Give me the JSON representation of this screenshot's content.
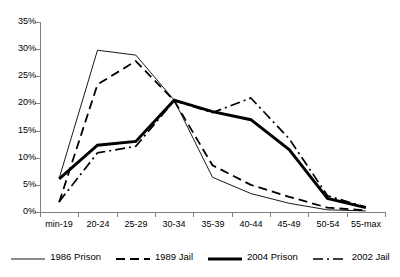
{
  "chart_data": {
    "type": "line",
    "title": "",
    "subtitle": "",
    "xlabel": "",
    "ylabel": "",
    "categories": [
      "min-19",
      "20-24",
      "25-29",
      "30-34",
      "35-39",
      "40-44",
      "45-49",
      "50-54",
      "55-max"
    ],
    "ytick_labels": [
      "0%",
      "5%",
      "10%",
      "15%",
      "20%",
      "25%",
      "30%",
      "35%"
    ],
    "ytick_values": [
      0,
      5,
      10,
      15,
      20,
      25,
      30,
      35
    ],
    "ylim": [
      0,
      35
    ],
    "yunit": "%",
    "grid": false,
    "legend_position": "bottom",
    "series": [
      {
        "name": "1986 Prison",
        "style": "thin-solid",
        "color": "#000000",
        "width": 0.9,
        "dash": "none",
        "values": [
          6.2,
          29.8,
          28.9,
          20.6,
          6.4,
          3.4,
          1.6,
          0.4,
          0.2
        ]
      },
      {
        "name": "1989 Jail",
        "style": "dashed",
        "color": "#000000",
        "width": 1.8,
        "dash": "9,5",
        "values": [
          1.8,
          23.5,
          27.8,
          20.5,
          8.6,
          5.0,
          2.8,
          0.8,
          0.3
        ]
      },
      {
        "name": "2004 Prison",
        "style": "thick-solid",
        "color": "#000000",
        "width": 2.9,
        "dash": "none",
        "values": [
          6.1,
          12.3,
          13.0,
          20.6,
          18.5,
          17.0,
          11.5,
          2.5,
          0.8
        ]
      },
      {
        "name": "2002 Jail",
        "style": "dash-dot",
        "color": "#000000",
        "width": 1.7,
        "dash": "10,4,2,4",
        "values": [
          1.9,
          10.9,
          12.1,
          20.5,
          18.3,
          21.0,
          13.5,
          3.0,
          0.9
        ]
      }
    ]
  },
  "legend": {
    "items": [
      {
        "label": "1986 Prison",
        "swatch": "thin-solid"
      },
      {
        "label": "1989 Jail",
        "swatch": "dashed"
      },
      {
        "label": "2004 Prison",
        "swatch": "thick-solid"
      },
      {
        "label": "2002 Jail",
        "swatch": "dash-dot"
      }
    ]
  }
}
